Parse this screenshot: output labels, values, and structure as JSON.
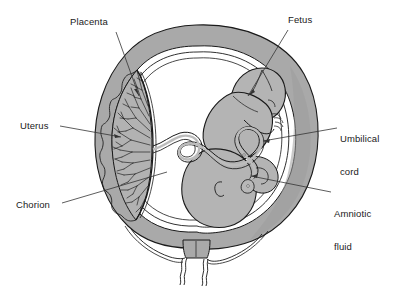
{
  "figure": {
    "kind": "anatomical-diagram",
    "style": "grayscale line drawing"
  },
  "colors": {
    "background": "#ffffff",
    "uterine_wall": "#a9a9a9",
    "uterine_wall_shadow": "#9a9a9a",
    "amniotic_cavity": "#ffffff",
    "fetus_body": "#b4b4b4",
    "placenta_villi": "#b0b0b0",
    "cord": "#bcbcbc",
    "outline": "#1a1a1a",
    "label_text": "#1a1a1a",
    "leader_line": "#333333"
  },
  "labels": [
    {
      "id": "placenta",
      "text": "Placenta",
      "x": 70,
      "y": 16,
      "align": "left",
      "leader": {
        "x1": 116,
        "y1": 32,
        "x2": 139,
        "y2": 96
      }
    },
    {
      "id": "fetus",
      "text": "Fetus",
      "x": 288,
      "y": 14,
      "align": "left",
      "leader": {
        "x1": 288,
        "y1": 30,
        "x2": 248,
        "y2": 96
      }
    },
    {
      "id": "uterus",
      "text": "Uterus",
      "x": 20,
      "y": 120,
      "align": "left",
      "leader": {
        "x1": 60,
        "y1": 126,
        "x2": 121,
        "y2": 137
      }
    },
    {
      "id": "umbilical-cord",
      "text": "Umbilical\ncord",
      "line1": "Umbilical",
      "line2": "cord",
      "x": 340,
      "y": 111,
      "align": "left",
      "leader": {
        "x1": 337,
        "y1": 128,
        "x2": 263,
        "y2": 141
      }
    },
    {
      "id": "chorion",
      "text": "Chorion",
      "x": 16,
      "y": 199,
      "align": "left",
      "leader": {
        "x1": 62,
        "y1": 203,
        "x2": 167,
        "y2": 172
      }
    },
    {
      "id": "amniotic-fluid",
      "text": "Amniotic\nfluid",
      "line1": "Amniotic",
      "line2": "fluid",
      "x": 334,
      "y": 186,
      "align": "left",
      "leader": {
        "x1": 331,
        "y1": 192,
        "x2": 251,
        "y2": 176
      }
    }
  ],
  "structures": [
    {
      "id": "uterine-wall",
      "name": "Uterus (myometrium)"
    },
    {
      "id": "chorion-membrane",
      "name": "Chorion membrane"
    },
    {
      "id": "amnion-membrane",
      "name": "Amnion membrane"
    },
    {
      "id": "amniotic-cavity",
      "name": "Amniotic fluid cavity"
    },
    {
      "id": "placenta",
      "name": "Placenta with chorionic villi"
    },
    {
      "id": "fetus",
      "name": "Fetus in flexed position"
    },
    {
      "id": "umbilical-cord",
      "name": "Umbilical cord"
    },
    {
      "id": "cervix",
      "name": "Cervix"
    },
    {
      "id": "vagina-walls",
      "name": "Vaginal canal walls"
    }
  ]
}
